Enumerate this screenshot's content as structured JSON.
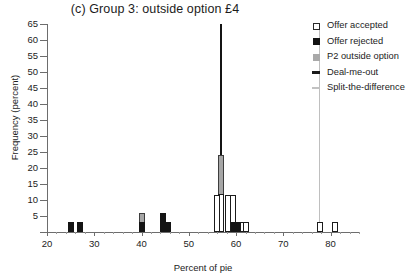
{
  "chart_data": {
    "type": "bar",
    "title": "(c) Group 3: outside option £4",
    "xlabel": "Percent of pie",
    "ylabel": "Frequency (percent)",
    "xlim": [
      20,
      86
    ],
    "ylim": [
      0,
      65
    ],
    "xticks": [
      20,
      30,
      40,
      50,
      60,
      70,
      80
    ],
    "yticks": [
      0,
      5,
      10,
      15,
      20,
      25,
      30,
      35,
      40,
      45,
      50,
      55,
      60,
      65
    ],
    "grid": false,
    "legend_position": "top-right",
    "legend": [
      {
        "key": "accepted",
        "label": "Offer accepted",
        "color": "#ffffff"
      },
      {
        "key": "rejected",
        "label": "Offer rejected",
        "color": "#121212"
      },
      {
        "key": "outside",
        "label": "P2 outside option",
        "color": "#a9a9a9"
      },
      {
        "key": "dealout",
        "label": "Deal-me-out",
        "color": "#1a1a1a"
      },
      {
        "key": "split",
        "label": "Split-the-difference",
        "color": "#c2c2c2"
      }
    ],
    "annotations": [
      {
        "type": "vline",
        "key": "split",
        "x": 77.5,
        "label": "Split-the-difference",
        "color": "#bfbfbf"
      }
    ],
    "bars": [
      {
        "x": 25.0,
        "value": 3.0,
        "series": "rejected"
      },
      {
        "x": 27.0,
        "value": 3.0,
        "series": "rejected"
      },
      {
        "x": 40.0,
        "value": 3.0,
        "series": "rejected"
      },
      {
        "x": 40.0,
        "value": 6.0,
        "series": "outside"
      },
      {
        "x": 44.5,
        "value": 6.0,
        "series": "rejected"
      },
      {
        "x": 45.5,
        "value": 3.0,
        "series": "rejected"
      },
      {
        "x": 56.0,
        "value": 11.5,
        "series": "accepted"
      },
      {
        "x": 56.8,
        "value": 12.0,
        "series": "accepted"
      },
      {
        "x": 56.8,
        "value": 24.0,
        "series": "outside"
      },
      {
        "x": 56.8,
        "value": 65.0,
        "series": "dealout"
      },
      {
        "x": 58.2,
        "value": 11.5,
        "series": "accepted"
      },
      {
        "x": 59.4,
        "value": 11.5,
        "series": "accepted"
      },
      {
        "x": 59.6,
        "value": 3.0,
        "series": "rejected"
      },
      {
        "x": 60.6,
        "value": 3.0,
        "series": "rejected"
      },
      {
        "x": 61.4,
        "value": 3.0,
        "series": "accepted"
      },
      {
        "x": 62.1,
        "value": 3.0,
        "series": "accepted"
      },
      {
        "x": 77.8,
        "value": 3.0,
        "series": "accepted"
      },
      {
        "x": 80.9,
        "value": 3.0,
        "series": "accepted"
      }
    ]
  }
}
